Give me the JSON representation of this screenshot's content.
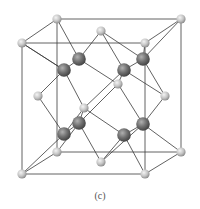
{
  "figure": {
    "caption": "(c)",
    "colors": {
      "light_atom": "#c8c8c8",
      "light_atom_highlight": "#f2f2f2",
      "dark_atom": "#6e6e6e",
      "dark_atom_highlight": "#a8a8a8",
      "bond": "#3a3a3a",
      "cube_edge": "#3a3a3a"
    },
    "cube": {
      "front": {
        "x1": 22,
        "y1": 43,
        "x2": 145,
        "y2": 174
      },
      "back": {
        "x1": 57,
        "y1": 19,
        "x2": 181,
        "y2": 152
      }
    },
    "light_atoms": [
      {
        "id": "corner-back-top-left",
        "x": 57,
        "y": 19
      },
      {
        "id": "corner-back-top-right",
        "x": 181,
        "y": 19
      },
      {
        "id": "corner-front-top-left",
        "x": 22,
        "y": 43
      },
      {
        "id": "corner-front-top-right",
        "x": 145,
        "y": 43
      },
      {
        "id": "face-top",
        "x": 101,
        "y": 31
      },
      {
        "id": "face-left",
        "x": 38,
        "y": 96
      },
      {
        "id": "face-right",
        "x": 165,
        "y": 96
      },
      {
        "id": "face-back",
        "x": 118,
        "y": 84
      },
      {
        "id": "face-front",
        "x": 84,
        "y": 108
      },
      {
        "id": "corner-back-bottom-left",
        "x": 57,
        "y": 152
      },
      {
        "id": "corner-back-bottom-right",
        "x": 181,
        "y": 152
      },
      {
        "id": "corner-front-bottom-left",
        "x": 22,
        "y": 174
      },
      {
        "id": "corner-front-bottom-right",
        "x": 145,
        "y": 174
      },
      {
        "id": "face-bottom",
        "x": 101,
        "y": 162
      }
    ],
    "dark_atoms": [
      {
        "id": "tetra-1",
        "x": 79,
        "y": 59
      },
      {
        "id": "tetra-2",
        "x": 64,
        "y": 70
      },
      {
        "id": "tetra-3",
        "x": 143,
        "y": 59
      },
      {
        "id": "tetra-4",
        "x": 124,
        "y": 70
      },
      {
        "id": "tetra-5",
        "x": 79,
        "y": 123
      },
      {
        "id": "tetra-6",
        "x": 64,
        "y": 134
      },
      {
        "id": "tetra-7",
        "x": 143,
        "y": 124
      },
      {
        "id": "tetra-8",
        "x": 124,
        "y": 135
      }
    ],
    "bonds": [
      [
        "face-top",
        "tetra-1"
      ],
      [
        "corner-back-top-left",
        "tetra-1"
      ],
      [
        "face-back",
        "tetra-1"
      ],
      [
        "corner-front-top-left",
        "tetra-2"
      ],
      [
        "tetra-1",
        "tetra-2"
      ],
      [
        "corner-front-top-left",
        "tetra-2"
      ],
      [
        "face-left",
        "tetra-2"
      ],
      [
        "face-front",
        "tetra-2"
      ],
      [
        "face-top",
        "tetra-3"
      ],
      [
        "corner-back-top-right",
        "tetra-3"
      ],
      [
        "face-right",
        "tetra-3"
      ],
      [
        "corner-front-top-right",
        "tetra-3"
      ],
      [
        "tetra-3",
        "tetra-4"
      ],
      [
        "face-top",
        "tetra-4"
      ],
      [
        "face-back",
        "tetra-4"
      ],
      [
        "face-front",
        "tetra-4"
      ],
      [
        "face-right",
        "tetra-4"
      ],
      [
        "face-front",
        "tetra-5"
      ],
      [
        "face-back",
        "tetra-5"
      ],
      [
        "corner-back-bottom-left",
        "tetra-5"
      ],
      [
        "face-bottom",
        "tetra-5"
      ],
      [
        "tetra-5",
        "tetra-6"
      ],
      [
        "face-left",
        "tetra-6"
      ],
      [
        "corner-front-bottom-left",
        "tetra-6"
      ],
      [
        "face-front",
        "tetra-6"
      ],
      [
        "face-back",
        "tetra-7"
      ],
      [
        "face-right",
        "tetra-7"
      ],
      [
        "corner-back-bottom-right",
        "tetra-7"
      ],
      [
        "face-bottom",
        "tetra-7"
      ],
      [
        "tetra-7",
        "tetra-8"
      ],
      [
        "face-front",
        "tetra-8"
      ],
      [
        "face-bottom",
        "tetra-8"
      ],
      [
        "corner-front-bottom-right",
        "tetra-8"
      ]
    ]
  }
}
